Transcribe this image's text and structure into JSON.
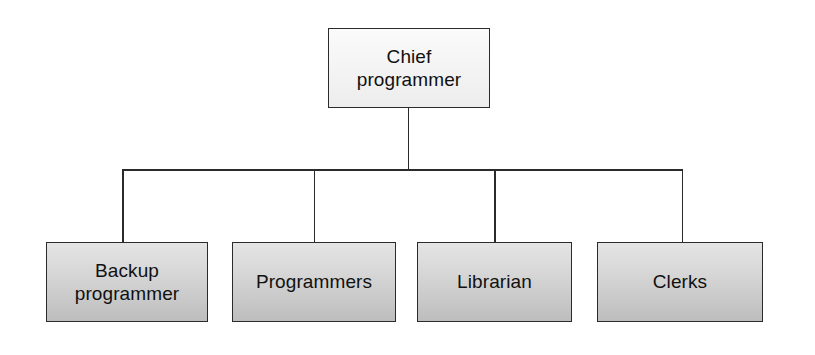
{
  "diagram": {
    "type": "organization-chart",
    "orientation": "top-down",
    "root": {
      "id": "chief-programmer",
      "label": "Chief\nprogrammer",
      "fill": "#f4f4f4",
      "border": "#2b2b2b"
    },
    "children": [
      {
        "id": "backup-programmer",
        "label": "Backup\nprogrammer",
        "fill": "#cfcfcf",
        "border": "#2b2b2b"
      },
      {
        "id": "programmers",
        "label": "Programmers",
        "fill": "#cfcfcf",
        "border": "#2b2b2b"
      },
      {
        "id": "librarian",
        "label": "Librarian",
        "fill": "#cfcfcf",
        "border": "#2b2b2b"
      },
      {
        "id": "clerks",
        "label": "Clerks",
        "fill": "#cfcfcf",
        "border": "#2b2b2b"
      }
    ],
    "connectors": {
      "style": "orthogonal-elbow",
      "color": "#2b2b2b",
      "description": "Single trunk from the root box down to a horizontal bus, with one vertical drop into each of the four child boxes."
    },
    "background": "#ffffff"
  }
}
